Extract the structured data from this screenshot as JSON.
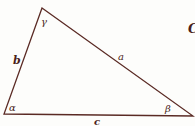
{
  "diagram": {
    "type": "triangle",
    "colors": {
      "stroke": "#5a2a24",
      "label": "#4a1f1a",
      "background": "#fdfdfb"
    },
    "vertices": {
      "top": [
        42,
        8
      ],
      "bottom_left": [
        4,
        114
      ],
      "bottom_right": [
        193,
        116
      ]
    },
    "sides": {
      "a": "a",
      "b": "b",
      "c": "c"
    },
    "angles": {
      "alpha": "α",
      "beta": "β",
      "gamma": "γ"
    },
    "partial_label": "C"
  }
}
